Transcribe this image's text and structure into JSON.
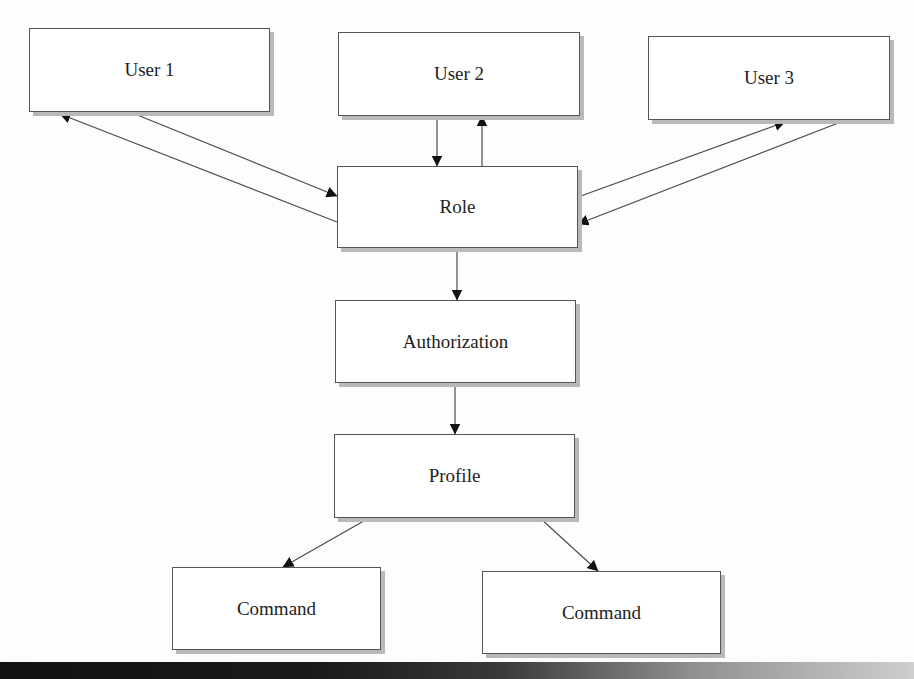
{
  "diagram": {
    "type": "flow",
    "nodes": [
      {
        "id": "user1",
        "label": "User 1",
        "x": 29,
        "y": 28,
        "w": 241,
        "h": 84
      },
      {
        "id": "user2",
        "label": "User 2",
        "x": 338,
        "y": 32,
        "w": 242,
        "h": 84
      },
      {
        "id": "user3",
        "label": "User 3",
        "x": 648,
        "y": 36,
        "w": 242,
        "h": 84
      },
      {
        "id": "role",
        "label": "Role",
        "x": 337,
        "y": 166,
        "w": 241,
        "h": 82
      },
      {
        "id": "authorization",
        "label": "Authorization",
        "x": 335,
        "y": 300,
        "w": 241,
        "h": 83
      },
      {
        "id": "profile",
        "label": "Profile",
        "x": 334,
        "y": 434,
        "w": 241,
        "h": 84
      },
      {
        "id": "command1",
        "label": "Command",
        "x": 172,
        "y": 567,
        "w": 209,
        "h": 83
      },
      {
        "id": "command2",
        "label": "Command",
        "x": 482,
        "y": 571,
        "w": 239,
        "h": 83
      }
    ],
    "edges": [
      {
        "from": "user1",
        "to": "role",
        "x1": 130,
        "y1": 112,
        "x2": 337,
        "y2": 196
      },
      {
        "from": "role",
        "to": "user1",
        "x1": 337,
        "y1": 222,
        "x2": 60,
        "y2": 114
      },
      {
        "from": "user2",
        "to": "role",
        "x1": 437,
        "y1": 116,
        "x2": 437,
        "y2": 166
      },
      {
        "from": "role",
        "to": "user2",
        "x1": 482,
        "y1": 166,
        "x2": 482,
        "y2": 116
      },
      {
        "from": "role",
        "to": "user3",
        "x1": 578,
        "y1": 197,
        "x2": 785,
        "y2": 122
      },
      {
        "from": "user3",
        "to": "role",
        "x1": 846,
        "y1": 120,
        "x2": 578,
        "y2": 224
      },
      {
        "from": "role",
        "to": "authorization",
        "x1": 457,
        "y1": 248,
        "x2": 457,
        "y2": 300
      },
      {
        "from": "authorization",
        "to": "profile",
        "x1": 455,
        "y1": 383,
        "x2": 455,
        "y2": 434
      },
      {
        "from": "profile",
        "to": "command1",
        "x1": 369,
        "y1": 518,
        "x2": 283,
        "y2": 567
      },
      {
        "from": "profile",
        "to": "command2",
        "x1": 540,
        "y1": 518,
        "x2": 598,
        "y2": 571
      }
    ],
    "colors": {
      "box_fill": "#ffffff",
      "box_border": "#555555",
      "box_shadow": "#b9b9b9",
      "line": "#4a4a4a",
      "arrowhead": "#111111",
      "text": "#1e1e1e",
      "background": "#fdfdfd"
    }
  }
}
